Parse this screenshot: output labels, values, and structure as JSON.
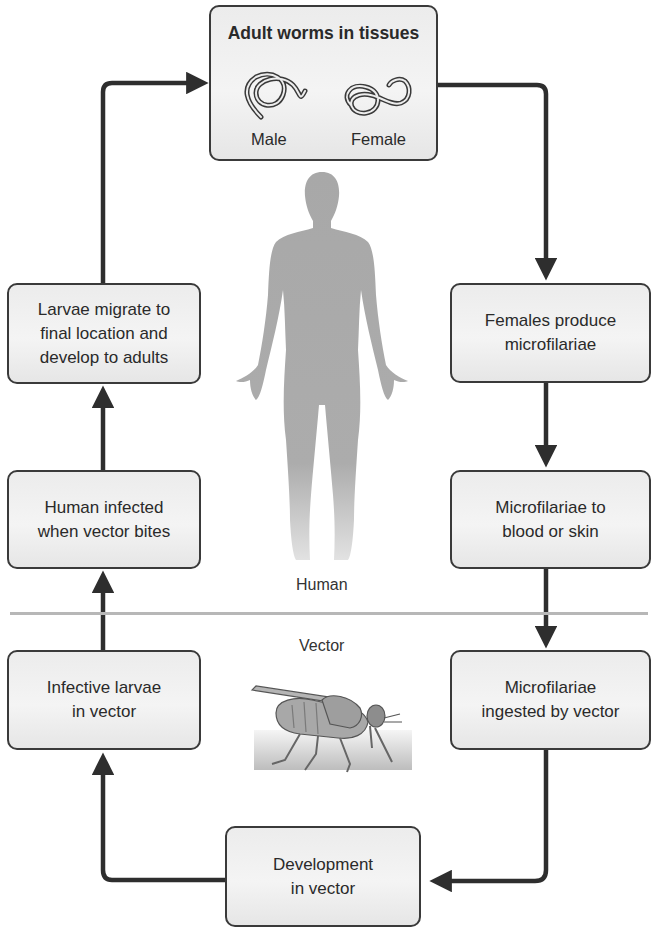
{
  "diagram": {
    "type": "life-cycle",
    "zones": {
      "upper": "Human",
      "lower": "Vector"
    },
    "top_box": {
      "title": "Adult worms in tissues",
      "male_label": "Male",
      "female_label": "Female"
    },
    "right_column": [
      {
        "label": "Females produce\nmicrofilariae"
      },
      {
        "label": "Microfilariae to\nblood or skin"
      },
      {
        "label": "Microfilariae\ningested by vector"
      }
    ],
    "bottom_box": {
      "label": "Development\nin vector"
    },
    "left_column": [
      {
        "label": "Infective larvae\nin vector"
      },
      {
        "label": "Human infected\nwhen vector bites"
      },
      {
        "label": "Larvae migrate to\nfinal location and\ndevelop to adults"
      }
    ],
    "flow": [
      "Adult worms in tissues",
      "Females produce microfilariae",
      "Microfilariae to blood or skin",
      "Microfilariae ingested by vector",
      "Development in vector",
      "Infective larvae in vector",
      "Human infected when vector bites",
      "Larvae migrate to final location and develop to adults"
    ],
    "illustrations": [
      "human-silhouette",
      "fly-vector",
      "male-worm",
      "female-worm"
    ],
    "colors": {
      "arrow": "#2e2e2e",
      "box_fill": "#ededed",
      "box_border": "#3a3a3a",
      "silhouette": "#a9a9a9",
      "divider": "#b7b7b7"
    }
  }
}
